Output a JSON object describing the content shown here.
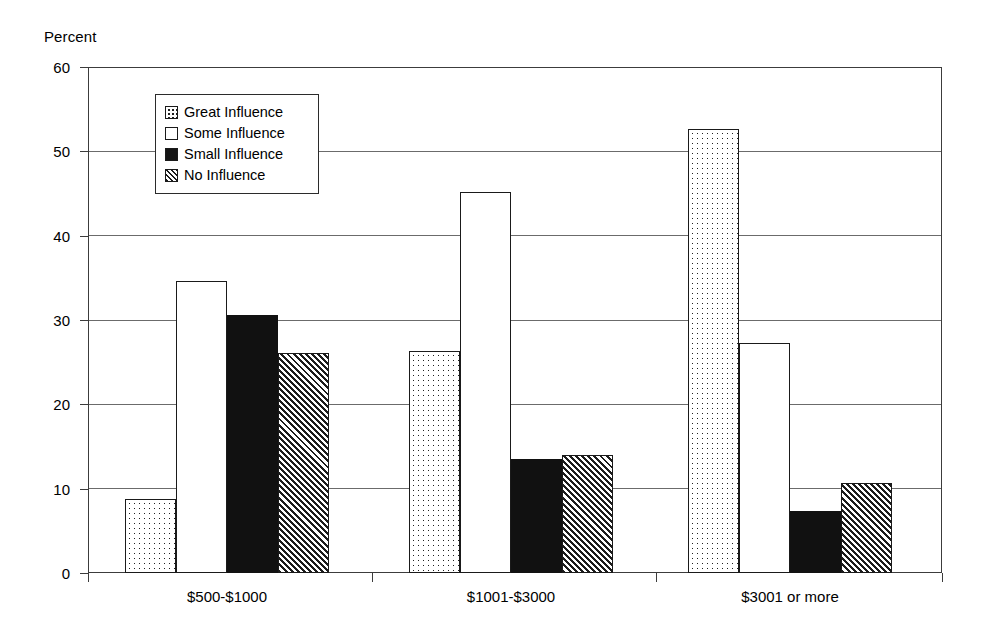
{
  "chart_data": {
    "type": "bar",
    "title": "",
    "subtitle": "",
    "xlabel": "",
    "ylabel": "Percent",
    "ylim": [
      0,
      60
    ],
    "y_ticks": [
      0,
      10,
      20,
      30,
      40,
      50,
      60
    ],
    "grid": true,
    "legend_position": "inside-top-left",
    "categories": [
      "$500-$1000",
      "$1001-$3000",
      "$3001 or more"
    ],
    "series": [
      {
        "name": "Great Influence",
        "pattern": "dotted",
        "values": [
          8.8,
          26.3,
          52.6
        ]
      },
      {
        "name": "Some Influence",
        "pattern": "white",
        "values": [
          34.6,
          45.2,
          27.3
        ]
      },
      {
        "name": "Small Influence",
        "pattern": "solid",
        "values": [
          30.6,
          13.5,
          7.4
        ]
      },
      {
        "name": "No Influence",
        "pattern": "hatch",
        "values": [
          26.1,
          14.0,
          10.7
        ]
      }
    ]
  },
  "axis": {
    "y_title": "Percent",
    "y_tick_labels": [
      "60",
      "50",
      "40",
      "30",
      "20",
      "10",
      "0"
    ],
    "x_tick_labels": [
      "$500-$1000",
      "$1001-$3000",
      "$3001 or more"
    ]
  },
  "legend": {
    "items": [
      {
        "label": "Great Influence"
      },
      {
        "label": "Some Influence"
      },
      {
        "label": "Small Influence"
      },
      {
        "label": "No Influence"
      }
    ]
  },
  "colors": {
    "axis": "#3c3c3c",
    "gridline": "#6b6b6b",
    "bar_outline": "#1a1a1a",
    "solid_fill": "#111111",
    "background": "#ffffff"
  }
}
